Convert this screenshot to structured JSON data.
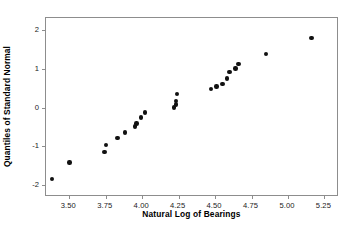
{
  "chart_data": {
    "type": "scatter",
    "title": "",
    "subtitle": "",
    "xlabel": "Natural Log of Bearings",
    "ylabel": "Quantiles of Standard Normal",
    "xlim": [
      3.34,
      5.35
    ],
    "ylim": [
      -2.3,
      2.3
    ],
    "xticks": [
      3.5,
      3.75,
      4.0,
      4.25,
      4.5,
      4.75,
      5.0,
      5.25
    ],
    "xticklabels": [
      "3.50",
      "3.75",
      "4.00",
      "4.25",
      "4.50",
      "4.75",
      "5.00",
      "5.25"
    ],
    "yticks": [
      2,
      1,
      0,
      -1,
      -2
    ],
    "yticklabels": [
      "2",
      "1",
      "0",
      "-1",
      "-2"
    ],
    "grid": false,
    "legend": null,
    "marker": "filled-circle",
    "marker_color": "#111111",
    "frame_color": "#8d8d8d",
    "background": "#ffffff",
    "n_points": 23,
    "x": [
      3.38,
      3.5,
      3.74,
      3.75,
      3.83,
      3.88,
      3.95,
      3.96,
      3.99,
      4.02,
      4.22,
      4.23,
      4.23,
      4.24,
      4.47,
      4.55,
      4.58,
      4.6,
      4.66,
      4.67,
      4.85,
      5.16,
      4.21
    ],
    "y": [
      -1.83,
      -1.41,
      -1.15,
      -0.96,
      -0.78,
      -0.64,
      -0.49,
      -0.41,
      -0.26,
      -0.13,
      0.0,
      0.08,
      0.15,
      0.35,
      0.47,
      0.6,
      0.75,
      0.92,
      1.12,
      0.92,
      1.37,
      1.79,
      0.0
    ],
    "points": [
      {
        "x": 3.38,
        "y": -1.83
      },
      {
        "x": 3.5,
        "y": -1.41
      },
      {
        "x": 3.74,
        "y": -1.15
      },
      {
        "x": 3.75,
        "y": -0.96
      },
      {
        "x": 3.83,
        "y": -0.78
      },
      {
        "x": 3.88,
        "y": -0.64
      },
      {
        "x": 3.95,
        "y": -0.49
      },
      {
        "x": 3.96,
        "y": -0.41
      },
      {
        "x": 3.99,
        "y": -0.26
      },
      {
        "x": 4.02,
        "y": -0.13
      },
      {
        "x": 4.22,
        "y": 0.0
      },
      {
        "x": 4.23,
        "y": 0.08
      },
      {
        "x": 4.23,
        "y": 0.16
      },
      {
        "x": 4.24,
        "y": 0.35
      },
      {
        "x": 4.47,
        "y": 0.47
      },
      {
        "x": 4.55,
        "y": 0.6
      },
      {
        "x": 4.58,
        "y": 0.75
      },
      {
        "x": 4.6,
        "y": 0.92
      },
      {
        "x": 4.66,
        "y": 1.12
      },
      {
        "x": 4.85,
        "y": 1.37
      },
      {
        "x": 5.16,
        "y": 1.79
      },
      {
        "x": 4.51,
        "y": 0.54
      },
      {
        "x": 4.64,
        "y": 1.0
      }
    ]
  }
}
